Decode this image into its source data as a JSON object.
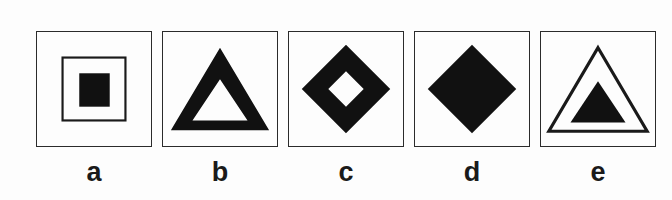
{
  "figure": {
    "background_color": "#fdfdfd",
    "shape_fill_color": "#111111",
    "shape_stroke_color": "#1a1a1a",
    "panel_border_color": "#2b2b2b",
    "panel_count": 5,
    "panels": [
      {
        "label": "a",
        "shape_name": "nested-squares",
        "description": "outlined square containing a smaller filled black square",
        "inner_outline_square": {
          "x": 26,
          "y": 26,
          "width": 64,
          "height": 64,
          "stroke_width": 2.2
        },
        "filled_square": {
          "x": 43,
          "y": 42,
          "width": 31,
          "height": 34
        }
      },
      {
        "label": "b",
        "shape_name": "thick-triangle-outline",
        "description": "thick black triangle band with white triangular hole",
        "outer_triangle_points": "58,16 108,100 8,100",
        "inner_triangle_points": "58,48 86,90 30,90"
      },
      {
        "label": "c",
        "shape_name": "thick-diamond-outline",
        "description": "thick black diamond band with white diamond hole",
        "outer_diamond_points": "58,13 103,58 58,103 13,58",
        "inner_diamond_points": "58,40 76,58 58,76 40,58"
      },
      {
        "label": "d",
        "shape_name": "filled-diamond",
        "description": "solid filled black diamond",
        "diamond_points": "58,13 103,58 58,103 13,58"
      },
      {
        "label": "e",
        "shape_name": "triangle-outline-with-inner-filled-triangle",
        "description": "thin-stroked large triangle containing a smaller filled black triangle",
        "outer_triangle_points": "58,16 108,101 8,101",
        "outer_triangle_stroke_width": 3.2,
        "filled_inner_triangle_points": "58,50 86,92 30,92"
      }
    ]
  }
}
